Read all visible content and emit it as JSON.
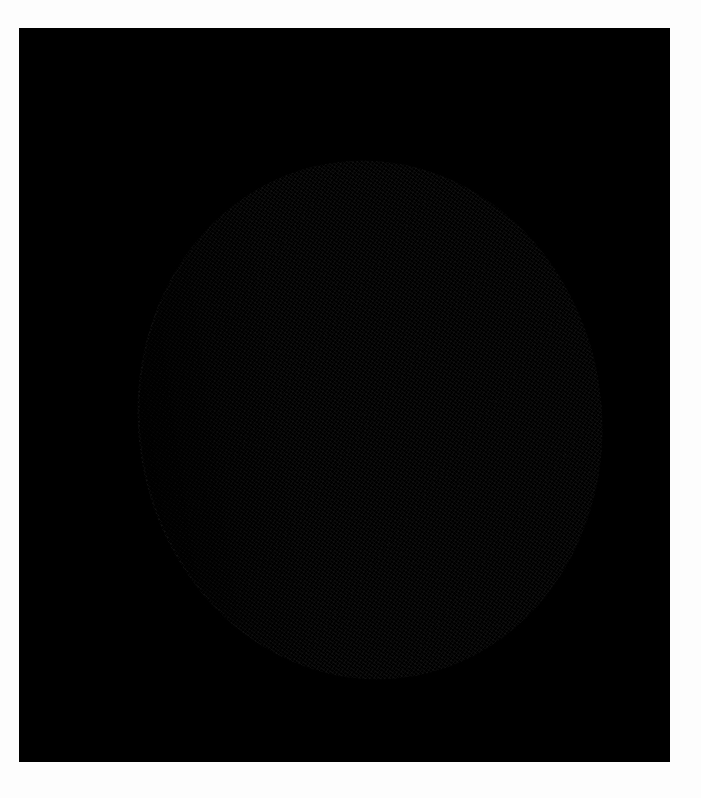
{
  "image": {
    "subject": "grayscale planetary disk",
    "description": "Grainy grayscale image of a planet-like sphere on a black background, with a bright haze ring and a darker central spot left of center",
    "colors": {
      "page_background": "#fdfdfd",
      "frame_background": "#000000",
      "disk_base": "#8a8a8a",
      "bright_band": "#c8c8c8",
      "dark_spot": "#464646"
    }
  }
}
